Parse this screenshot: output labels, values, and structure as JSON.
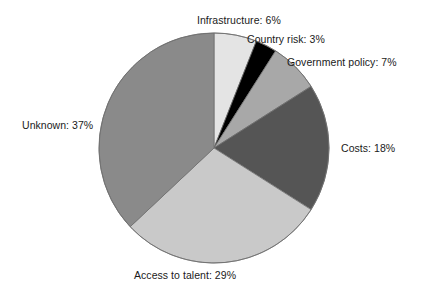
{
  "chart_data": {
    "type": "pie",
    "title": "",
    "subtitle": "",
    "xlabel": "",
    "ylabel": "",
    "legend_position": "none",
    "grid": false,
    "units": "percent",
    "start_angle_deg": 0,
    "direction": "clockwise",
    "total": 100,
    "categories": [
      "Infrastructure",
      "Country risk",
      "Government policy",
      "Costs",
      "Access to talent",
      "Unknown"
    ],
    "values": [
      6,
      3,
      7,
      18,
      29,
      37
    ],
    "labels": [
      "Infrastructure: 6%",
      "Country risk: 3%",
      "Government policy: 7%",
      "Costs: 18%",
      "Access to talent: 29%",
      "Unknown: 37%"
    ],
    "colors": [
      "#e4e4e4",
      "#000000",
      "#a8a8a8",
      "#555555",
      "#c9c9c9",
      "#8a8a8a"
    ],
    "slices": [
      {
        "name": "Infrastructure",
        "value": 6,
        "label": "Infrastructure: 6%",
        "color": "#e4e4e4"
      },
      {
        "name": "Country risk",
        "value": 3,
        "label": "Country risk: 3%",
        "color": "#000000"
      },
      {
        "name": "Government policy",
        "value": 7,
        "label": "Government policy: 7%",
        "color": "#a8a8a8"
      },
      {
        "name": "Costs",
        "value": 18,
        "label": "Costs: 18%",
        "color": "#555555"
      },
      {
        "name": "Access to talent",
        "value": 29,
        "label": "Access to talent: 29%",
        "color": "#c9c9c9"
      },
      {
        "name": "Unknown",
        "value": 37,
        "label": "Unknown: 37%",
        "color": "#8a8a8a"
      }
    ],
    "geometry": {
      "center_x": 214,
      "center_y": 148,
      "radius": 115,
      "stroke_color": "#6e6e6e",
      "stroke_width": 0.8
    },
    "background": "#ffffff"
  }
}
